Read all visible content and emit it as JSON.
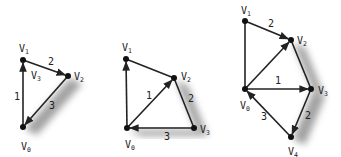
{
  "colors": {
    "edge": "#222222",
    "vertex": "#111111",
    "shadow": "#555555",
    "background": "#ffffff"
  },
  "diagrams": [
    {
      "id": "graph-1",
      "vertices": [
        {
          "name": "V0",
          "base": "V",
          "sub": "0",
          "x": 23,
          "y": 127,
          "lx": 21,
          "ly": 150
        },
        {
          "name": "V1",
          "base": "V",
          "sub": "1",
          "x": 23,
          "y": 60,
          "lx": 19,
          "ly": 52
        },
        {
          "name": "V2",
          "base": "V",
          "sub": "2",
          "x": 68,
          "y": 76,
          "lx": 74,
          "ly": 80
        }
      ],
      "edges": [
        {
          "from": 0,
          "to": 1,
          "label": "1",
          "arrow": "to",
          "lx": 14,
          "ly": 100,
          "shadow": false
        },
        {
          "from": 1,
          "to": 2,
          "label": "2",
          "arrow": "to",
          "lx": 48,
          "ly": 65,
          "shadow": false
        },
        {
          "from": 2,
          "to": 0,
          "label": "3",
          "arrow": "to",
          "lx": 49,
          "ly": 109,
          "shadow": true
        }
      ],
      "annotations": [
        {
          "base": "V",
          "sub": "3",
          "x": 31,
          "y": 79
        }
      ]
    },
    {
      "id": "graph-2",
      "vertices": [
        {
          "name": "V0",
          "base": "V",
          "sub": "0",
          "x": 127,
          "y": 128,
          "lx": 125,
          "ly": 148
        },
        {
          "name": "V1",
          "base": "V",
          "sub": "1",
          "x": 126,
          "y": 59,
          "lx": 122,
          "ly": 51
        },
        {
          "name": "V2",
          "base": "V",
          "sub": "2",
          "x": 174,
          "y": 78,
          "lx": 181,
          "ly": 80
        },
        {
          "name": "V3",
          "base": "V",
          "sub": "3",
          "x": 194,
          "y": 128,
          "lx": 200,
          "ly": 133
        }
      ],
      "edges": [
        {
          "from": 0,
          "to": 1,
          "label": "",
          "arrow": "to",
          "lx": 0,
          "ly": 0,
          "shadow": false
        },
        {
          "from": 1,
          "to": 2,
          "label": "",
          "arrow": "none",
          "lx": 0,
          "ly": 0,
          "shadow": false
        },
        {
          "from": 0,
          "to": 2,
          "label": "1",
          "arrow": "to",
          "lx": 146,
          "ly": 99,
          "shadow": false
        },
        {
          "from": 2,
          "to": 3,
          "label": "2",
          "arrow": "none",
          "lx": 188,
          "ly": 102,
          "shadow": true
        },
        {
          "from": 3,
          "to": 0,
          "label": "3",
          "arrow": "to",
          "lx": 164,
          "ly": 140,
          "shadow": true
        }
      ],
      "annotations": []
    },
    {
      "id": "graph-3",
      "vertices": [
        {
          "name": "V0",
          "base": "V",
          "sub": "0",
          "x": 245,
          "y": 89,
          "lx": 240,
          "ly": 109
        },
        {
          "name": "V1",
          "base": "V",
          "sub": "1",
          "x": 245,
          "y": 21,
          "lx": 241,
          "ly": 14
        },
        {
          "name": "V2",
          "base": "V",
          "sub": "2",
          "x": 291,
          "y": 40,
          "lx": 297,
          "ly": 44
        },
        {
          "name": "V3",
          "base": "V",
          "sub": "3",
          "x": 311,
          "y": 89,
          "lx": 318,
          "ly": 94
        },
        {
          "name": "V4",
          "base": "V",
          "sub": "4",
          "x": 291,
          "y": 137,
          "lx": 288,
          "ly": 155
        }
      ],
      "edges": [
        {
          "from": 1,
          "to": 0,
          "label": "",
          "arrow": "none",
          "lx": 0,
          "ly": 0,
          "shadow": false
        },
        {
          "from": 1,
          "to": 2,
          "label": "2",
          "arrow": "to",
          "lx": 268,
          "ly": 27,
          "shadow": false
        },
        {
          "from": 0,
          "to": 2,
          "label": "",
          "arrow": "to",
          "lx": 0,
          "ly": 0,
          "shadow": false
        },
        {
          "from": 0,
          "to": 3,
          "label": "1",
          "arrow": "to",
          "lx": 275,
          "ly": 84,
          "shadow": false
        },
        {
          "from": 2,
          "to": 3,
          "label": "",
          "arrow": "none",
          "lx": 0,
          "ly": 0,
          "shadow": true
        },
        {
          "from": 3,
          "to": 4,
          "label": "2",
          "arrow": "to",
          "lx": 305,
          "ly": 119,
          "shadow": true
        },
        {
          "from": 4,
          "to": 0,
          "label": "3",
          "arrow": "to",
          "lx": 261,
          "ly": 120,
          "shadow": false
        }
      ],
      "annotations": []
    }
  ]
}
